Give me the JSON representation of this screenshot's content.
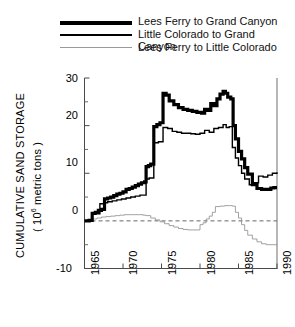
{
  "chart_data": {
    "type": "line",
    "title": "",
    "xlabel": "",
    "ylabel": "CUMULATIVE SAND STORAGE",
    "ylabel_units": "( 10⁶ metric tons )",
    "xlim": [
      1965,
      1990
    ],
    "ylim": [
      -10,
      30
    ],
    "xticks": [
      1965,
      1970,
      1975,
      1980,
      1985,
      1990
    ],
    "yticks": [
      -10,
      0,
      10,
      20,
      30
    ],
    "ytick_labels": [
      "-10",
      "0",
      "10",
      "20",
      "30"
    ],
    "xtick_labels": [
      "1965",
      "1970",
      "1975",
      "1980",
      "1985",
      "1990"
    ],
    "minor_yticks": [
      -5,
      5,
      15,
      25
    ],
    "grid": false,
    "zero_reference_line": {
      "value": 0,
      "style": "dashed",
      "color": "#666666"
    },
    "legend_position": "above-plot",
    "series": [
      {
        "name": "Lees Ferry to Grand Canyon",
        "style": "thick",
        "linewidth": 3.2,
        "color": "#000000",
        "x": [
          1965.0,
          1965.6,
          1966.0,
          1966.4,
          1966.8,
          1967.2,
          1967.6,
          1968.0,
          1968.4,
          1968.8,
          1969.2,
          1969.6,
          1970.0,
          1970.4,
          1970.8,
          1971.2,
          1971.6,
          1972.0,
          1972.4,
          1972.8,
          1973.0,
          1973.3,
          1973.6,
          1974.0,
          1974.4,
          1974.8,
          1975.2,
          1975.6,
          1976.0,
          1976.6,
          1977.2,
          1977.8,
          1978.4,
          1979.0,
          1979.6,
          1980.2,
          1980.6,
          1981.0,
          1981.4,
          1981.8,
          1982.2,
          1982.6,
          1983.0,
          1983.3,
          1983.6,
          1984.0,
          1984.3,
          1984.6,
          1985.0,
          1985.4,
          1985.8,
          1986.2,
          1986.8,
          1987.4,
          1988.0,
          1988.6,
          1989.2,
          1989.6,
          1990.0
        ],
        "y": [
          0.0,
          0.1,
          1.6,
          1.8,
          2.2,
          2.4,
          4.6,
          4.8,
          5.0,
          5.3,
          5.6,
          5.8,
          6.1,
          6.6,
          6.8,
          7.1,
          7.4,
          7.7,
          8.0,
          8.2,
          11.4,
          11.6,
          11.9,
          19.8,
          20.2,
          20.6,
          26.8,
          26.4,
          25.2,
          24.4,
          23.8,
          23.4,
          23.2,
          23.0,
          22.8,
          22.6,
          23.4,
          23.2,
          24.6,
          24.2,
          25.6,
          26.6,
          27.2,
          26.8,
          26.0,
          25.6,
          20.0,
          17.2,
          14.6,
          13.0,
          11.2,
          9.8,
          7.6,
          6.8,
          6.6,
          6.6,
          6.9,
          7.0,
          7.0
        ]
      },
      {
        "name": "Little Colorado to Grand Canyon",
        "style": "medium",
        "linewidth": 1.4,
        "color": "#000000",
        "x": [
          1965.0,
          1965.6,
          1966.0,
          1966.4,
          1967.0,
          1967.6,
          1968.0,
          1968.6,
          1969.2,
          1969.8,
          1970.4,
          1971.0,
          1971.6,
          1972.2,
          1972.8,
          1973.0,
          1973.4,
          1974.0,
          1974.6,
          1975.2,
          1975.8,
          1976.4,
          1977.0,
          1977.6,
          1978.2,
          1978.8,
          1979.4,
          1980.0,
          1980.6,
          1981.2,
          1981.8,
          1982.4,
          1983.0,
          1983.4,
          1983.8,
          1984.2,
          1984.6,
          1985.0,
          1985.4,
          1985.8,
          1986.4,
          1987.0,
          1987.6,
          1988.2,
          1988.8,
          1989.4,
          1990.0
        ],
        "y": [
          0.0,
          0.1,
          1.4,
          1.5,
          3.6,
          3.8,
          4.0,
          4.2,
          4.4,
          4.6,
          4.8,
          5.0,
          5.2,
          5.4,
          5.4,
          8.8,
          9.0,
          16.4,
          16.6,
          19.6,
          19.4,
          18.8,
          18.6,
          18.4,
          18.4,
          18.3,
          18.2,
          18.4,
          19.0,
          18.6,
          19.4,
          19.6,
          20.2,
          19.6,
          19.8,
          15.4,
          13.2,
          11.6,
          10.0,
          8.8,
          7.6,
          8.0,
          9.4,
          9.2,
          9.6,
          10.0,
          10.2
        ]
      },
      {
        "name": "Lees Ferry to Little Colorado",
        "style": "thin",
        "linewidth": 0.8,
        "color": "#8a8a8a",
        "x": [
          1965.0,
          1965.6,
          1966.0,
          1966.6,
          1967.2,
          1967.8,
          1968.4,
          1969.0,
          1969.6,
          1970.2,
          1970.8,
          1971.4,
          1972.0,
          1972.6,
          1973.0,
          1973.6,
          1974.2,
          1974.8,
          1975.4,
          1976.0,
          1976.6,
          1977.2,
          1977.8,
          1978.4,
          1979.0,
          1979.6,
          1980.0,
          1980.4,
          1980.8,
          1981.2,
          1981.6,
          1982.0,
          1982.6,
          1983.2,
          1983.8,
          1984.2,
          1984.6,
          1985.0,
          1985.4,
          1985.8,
          1986.2,
          1986.8,
          1987.4,
          1988.0,
          1988.6,
          1989.2,
          1990.0
        ],
        "y": [
          0.0,
          0.1,
          0.4,
          0.6,
          0.8,
          0.9,
          1.0,
          1.1,
          1.2,
          1.3,
          1.3,
          1.3,
          1.3,
          1.2,
          1.1,
          0.6,
          0.2,
          -0.2,
          -0.6,
          -1.0,
          -1.3,
          -1.6,
          -1.8,
          -1.9,
          -1.9,
          -1.9,
          -0.8,
          -0.4,
          0.4,
          1.0,
          1.8,
          3.0,
          3.1,
          3.2,
          3.2,
          3.1,
          1.8,
          0.6,
          -0.8,
          -2.0,
          -3.0,
          -3.8,
          -4.4,
          -4.8,
          -5.0,
          -5.0,
          -5.0
        ]
      }
    ]
  },
  "legend": {
    "items": [
      {
        "label": "Lees Ferry to Grand Canyon",
        "style": "thick"
      },
      {
        "label": "Little Colorado to Grand Canyon",
        "style": "medium"
      },
      {
        "label": "Lees Ferry to Little Colorado",
        "style": "thin"
      }
    ]
  },
  "axes": {
    "y_title_main": "CUMULATIVE SAND STORAGE",
    "y_title_units_pre": "( 10",
    "y_title_units_exp": "6",
    "y_title_units_post": " metric tons )"
  }
}
